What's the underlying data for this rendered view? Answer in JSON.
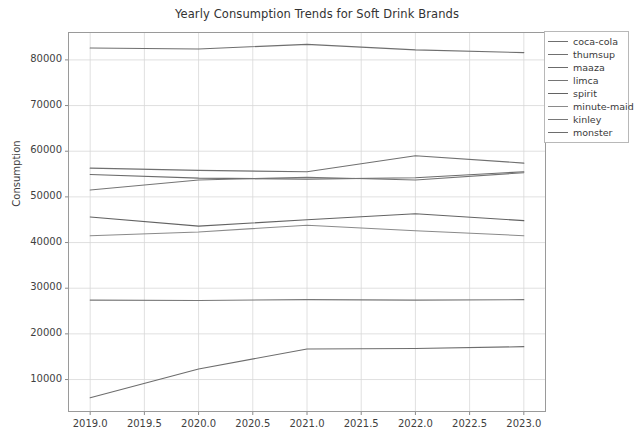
{
  "chart_data": {
    "type": "line",
    "title": "Yearly Consumption Trends for Soft Drink Brands",
    "xlabel": "",
    "ylabel": "Consumption",
    "x": [
      2019,
      2020,
      2021,
      2022,
      2023
    ],
    "xlim": [
      2018.8,
      2023.2
    ],
    "ylim": [
      3000,
      86000
    ],
    "xticks": [
      2019.0,
      2019.5,
      2020.0,
      2020.5,
      2021.0,
      2021.5,
      2022.0,
      2022.5,
      2023.0
    ],
    "xtick_labels": [
      "2019.0",
      "2019.5",
      "2020.0",
      "2020.5",
      "2021.0",
      "2021.5",
      "2022.0",
      "2022.5",
      "2023.0"
    ],
    "yticks": [
      10000,
      20000,
      30000,
      40000,
      50000,
      60000,
      70000,
      80000
    ],
    "ytick_labels": [
      "10000",
      "20000",
      "30000",
      "40000",
      "50000",
      "60000",
      "70000",
      "80000"
    ],
    "grid": true,
    "legend_position": "upper right",
    "series": [
      {
        "name": "coca-cola",
        "color": "#6f6f6f",
        "values": [
          82600,
          82400,
          83400,
          82200,
          81600
        ]
      },
      {
        "name": "thumsup",
        "color": "#707070",
        "values": [
          56300,
          55800,
          55500,
          59000,
          57400
        ]
      },
      {
        "name": "maaza",
        "color": "#6b6b6b",
        "values": [
          54900,
          54100,
          53900,
          54200,
          55500
        ]
      },
      {
        "name": "limca",
        "color": "#757575",
        "values": [
          51500,
          53700,
          54300,
          53700,
          55300
        ]
      },
      {
        "name": "spirit",
        "color": "#636363",
        "values": [
          45600,
          43600,
          45000,
          46300,
          44800
        ]
      },
      {
        "name": "minute-maid",
        "color": "#8a8a8a",
        "values": [
          41500,
          42300,
          43800,
          42600,
          41500
        ]
      },
      {
        "name": "kinley",
        "color": "#787878",
        "values": [
          27400,
          27300,
          27500,
          27400,
          27500
        ]
      },
      {
        "name": "monster",
        "color": "#6d6d6d",
        "values": [
          6000,
          12300,
          16700,
          16800,
          17200
        ]
      }
    ]
  },
  "legend": {
    "items": [
      {
        "label": "coca-cola"
      },
      {
        "label": "thumsup"
      },
      {
        "label": "maaza"
      },
      {
        "label": "limca"
      },
      {
        "label": "spirit"
      },
      {
        "label": "minute-maid"
      },
      {
        "label": "kinley"
      },
      {
        "label": "monster"
      }
    ]
  }
}
